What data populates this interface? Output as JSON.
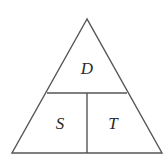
{
  "diagram": {
    "type": "formula-triangle",
    "colors": {
      "stroke": "#555555",
      "text": "#2a2a2a",
      "background": "#ffffff"
    },
    "top": {
      "label": "D"
    },
    "bottom_left": {
      "label": "S"
    },
    "bottom_right": {
      "label": "T"
    }
  }
}
